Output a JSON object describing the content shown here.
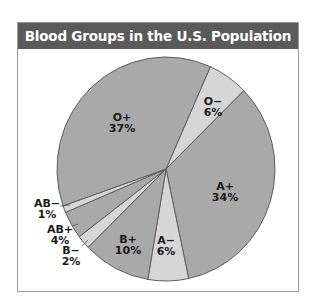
{
  "title": "Blood Groups in the U.S. Population",
  "colors": {
    "title_bar": "#5a5a5a",
    "frame_border": "#9a9a9a",
    "slice_dark": "#a9a9a9",
    "slice_light": "#d6d6d6",
    "slice_edge": "#5e5e5e"
  },
  "chart_data": {
    "type": "pie",
    "title": "Blood Groups in the U.S. Population",
    "categories": [
      "O-",
      "A+",
      "A-",
      "B+",
      "B-",
      "AB+",
      "AB-",
      "O+"
    ],
    "values": [
      6,
      34,
      6,
      10,
      2,
      4,
      1,
      37
    ],
    "unit": "%",
    "slice_shading": [
      "light",
      "dark",
      "light",
      "dark",
      "light",
      "dark",
      "light",
      "dark"
    ],
    "start_angle_deg_clockwise_from_top": 24,
    "legend": "none (labels placed on/next to slices)"
  },
  "labels": [
    {
      "name": "O−",
      "pct": "6%"
    },
    {
      "name": "A+",
      "pct": "34%"
    },
    {
      "name": "A−",
      "pct": "6%"
    },
    {
      "name": "B+",
      "pct": "10%"
    },
    {
      "name": "B−",
      "pct": "2%"
    },
    {
      "name": "AB+",
      "pct": "4%"
    },
    {
      "name": "AB−",
      "pct": "1%"
    },
    {
      "name": "O+",
      "pct": "37%"
    }
  ]
}
